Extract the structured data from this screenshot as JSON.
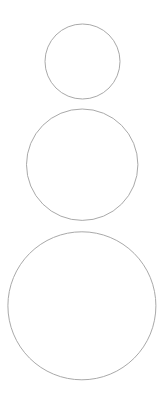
{
  "canvas": {
    "width": 168,
    "height": 418,
    "background": "#ffffff"
  },
  "style": {
    "stroke": "#a9a9a9",
    "stroke_width": 1,
    "fill": "none"
  },
  "circles": [
    {
      "id": "small",
      "cx": 82.5,
      "cy": 61.5,
      "r": 37.5
    },
    {
      "id": "medium",
      "cx": 82.2,
      "cy": 164.7,
      "r": 55.7
    },
    {
      "id": "large",
      "cx": 81.9,
      "cy": 305.8,
      "r": 74
    }
  ]
}
